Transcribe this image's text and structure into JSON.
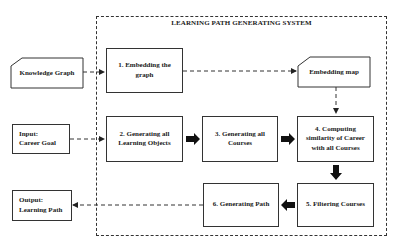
{
  "diagram": {
    "system_title": "LEARNING PATH GENERATING SYSTEM",
    "external": {
      "knowledge_graph": "Knowledge Graph",
      "input": {
        "line1": "Input:",
        "line2": "Career Goal"
      },
      "output": {
        "line1": "Output:",
        "line2": "Learning Path"
      }
    },
    "steps": [
      {
        "id": 1,
        "line1": "1. Embedding the",
        "line2": "graph"
      },
      {
        "id": 2,
        "line1": "2. Generating all",
        "line2": "Learning Objects"
      },
      {
        "id": 3,
        "line1": "3. Generating all",
        "line2": "Courses"
      },
      {
        "id": 4,
        "line1": "4. Computing",
        "line2": "similarity of Career",
        "line3": "with all Courses"
      },
      {
        "id": 5,
        "line1": "5. Filtering Courses"
      },
      {
        "id": 6,
        "line1": "6. Generating Path"
      }
    ],
    "embedding_map": "Embedding map",
    "edges": [
      {
        "from": "Knowledge Graph",
        "to": "1. Embedding the graph",
        "style": "dashed"
      },
      {
        "from": "1. Embedding the graph",
        "to": "Embedding map",
        "style": "dashed"
      },
      {
        "from": "Embedding map",
        "to": "4. Computing similarity of Career with all Courses",
        "style": "dashed"
      },
      {
        "from": "Input: Career Goal",
        "to": "2. Generating all Learning Objects",
        "style": "dashed"
      },
      {
        "from": "2. Generating all Learning Objects",
        "to": "3. Generating all Courses",
        "style": "block-arrow"
      },
      {
        "from": "3. Generating all Courses",
        "to": "4. Computing similarity of Career with all Courses",
        "style": "block-arrow"
      },
      {
        "from": "4. Computing similarity of Career with all Courses",
        "to": "5. Filtering Courses",
        "style": "block-arrow"
      },
      {
        "from": "5. Filtering Courses",
        "to": "6. Generating Path",
        "style": "block-arrow"
      },
      {
        "from": "6. Generating Path",
        "to": "Output: Learning Path",
        "style": "dashed"
      }
    ]
  }
}
